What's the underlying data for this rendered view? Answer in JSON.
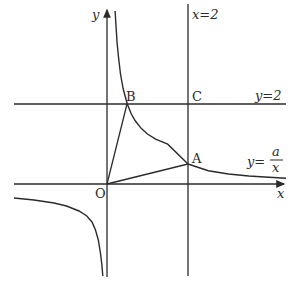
{
  "figure": {
    "width": 296,
    "height": 289,
    "stroke_color": "#2b2b2b",
    "background": "#ffffff",
    "scale": {
      "origin_px": [
        107,
        184
      ],
      "unit_x_px": 40.5,
      "unit_y_px": 40
    },
    "axes": {
      "x_label": "x",
      "y_label": "y"
    },
    "lines": {
      "vertical": {
        "label": "x=2",
        "x_value": 2
      },
      "horizontal": {
        "label": "y=2",
        "y_value": 2
      }
    },
    "curve": {
      "label_prefix": "y=",
      "label_numerator": "a",
      "label_denominator": "x",
      "equation": "y = a/x"
    },
    "points": {
      "O": {
        "label": "O",
        "coords": [
          0,
          0
        ]
      },
      "A": {
        "label": "A",
        "coords": [
          2,
          0.5
        ]
      },
      "B": {
        "label": "B",
        "coords": [
          0.5,
          2
        ]
      },
      "C": {
        "label": "C",
        "coords": [
          2,
          2
        ]
      }
    },
    "triangle": [
      "O",
      "A",
      "B"
    ]
  }
}
